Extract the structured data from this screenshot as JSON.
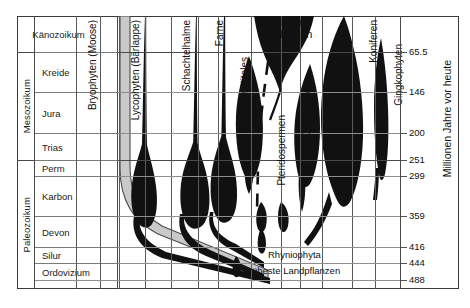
{
  "figure": {
    "axis_title": "Millionen Jahre vor heute",
    "bg_color": "#ffffff",
    "silhouette_color": "#111111",
    "bryophyte_color": "#c9c9c9",
    "rule_color": "#8e8e8e"
  },
  "eons": [
    {
      "label": "Känozoikum",
      "top": 17,
      "bottom": 52
    },
    {
      "label": "Mesozoikum",
      "top": 52,
      "bottom": 160
    },
    {
      "label": "Paleozoikum",
      "top": 160,
      "bottom": 288
    }
  ],
  "periods": [
    {
      "label": "Känozoikum",
      "top": 17,
      "bottom": 52,
      "centered": true
    },
    {
      "label": "Kreide",
      "top": 52,
      "bottom": 92,
      "centered": false
    },
    {
      "label": "Jura",
      "top": 92,
      "bottom": 133,
      "centered": false
    },
    {
      "label": "Trias",
      "top": 133,
      "bottom": 160,
      "centered": false
    },
    {
      "label": "Perm",
      "top": 160,
      "bottom": 176,
      "centered": false
    },
    {
      "label": "Karbon",
      "top": 176,
      "bottom": 216,
      "centered": false
    },
    {
      "label": "Devon",
      "top": 216,
      "bottom": 247,
      "centered": false
    },
    {
      "label": "Silur",
      "top": 247,
      "bottom": 263,
      "centered": false
    },
    {
      "label": "Ordovizium",
      "top": 263,
      "bottom": 280,
      "centered": false
    }
  ],
  "age_axis": {
    "unit_label": "Millionen Jahre vor heute",
    "ticks": [
      {
        "value": "65.5",
        "y": 52
      },
      {
        "value": "146",
        "y": 92
      },
      {
        "value": "200",
        "y": 133
      },
      {
        "value": "251",
        "y": 160
      },
      {
        "value": "299",
        "y": 176
      },
      {
        "value": "359",
        "y": 216
      },
      {
        "value": "416",
        "y": 247
      },
      {
        "value": "444",
        "y": 263
      },
      {
        "value": "488",
        "y": 280
      }
    ]
  },
  "taxa": [
    {
      "name": "Bryophyten (Moose)",
      "label_x": 88,
      "label_y": 20,
      "kind": "gray-band"
    },
    {
      "name": "Lycophyten (Bärlappe)",
      "label_x": 131,
      "label_y": 20,
      "kind": "spindle"
    },
    {
      "name": "Schachtelhalme",
      "label_x": 182,
      "label_y": 20,
      "kind": "spindle"
    },
    {
      "name": "Farne",
      "label_x": 215,
      "label_y": 20,
      "kind": "spindle"
    },
    {
      "name": "Benetitales",
      "label_x": 240,
      "label_y": 57,
      "kind": "spindle"
    },
    {
      "name": "Blüten-Pflanzen",
      "label_x": 281,
      "label_y": 20,
      "kind": "spindle-big"
    },
    {
      "name": "Pteridospermen",
      "label_x": 277,
      "label_y": 115,
      "kind": "dashed"
    },
    {
      "name": "Cycadeen",
      "label_x": 302,
      "label_y": 92,
      "kind": "spindle"
    },
    {
      "name": "Koniferen",
      "label_x": 369,
      "label_y": 20,
      "kind": "spindle"
    },
    {
      "name": "Gingkophyten",
      "label_x": 394,
      "label_y": 44,
      "kind": "spindle"
    }
  ],
  "annotations": [
    {
      "text": "Rhyniophyta",
      "x": 268,
      "y": 255
    },
    {
      "text": "Früheste Landpflanzen",
      "x": 243,
      "y": 271
    }
  ],
  "big_labels": [
    {
      "line1": "Blüten-",
      "line2": "Pflanzen",
      "x": 280,
      "y": 19
    }
  ],
  "lane_separators": [
    76,
    100,
    119,
    145,
    171,
    198,
    218,
    251,
    281,
    300,
    322,
    352,
    375,
    400
  ],
  "chart_data": {
    "type": "area",
    "xlabel": "Relative Diversität (Breite der Spindel)",
    "ylabel": "Millionen Jahre vor heute",
    "ylim": [
      488,
      0
    ],
    "y_ticks": [
      65.5,
      146,
      200,
      251,
      299,
      359,
      416,
      444,
      488
    ],
    "grid": true,
    "legend": "none",
    "categories": [
      "Bryophyten (Moose)",
      "Lycophyten (Bärlappe)",
      "Schachtelhalme",
      "Farne",
      "Benetitales",
      "Blütenpflanzen",
      "Pteridospermen",
      "Cycadeen",
      "Koniferen",
      "Gingkophyten"
    ],
    "series": [
      {
        "name": "Bryophyten (Moose)",
        "first_appearance_ma": 450,
        "present_today": true,
        "peak_ma": 0,
        "note": "graues Band, konstant schmal bis heute"
      },
      {
        "name": "Lycophyten (Bärlappe)",
        "first_appearance_ma": 430,
        "present_today": true,
        "peak_ma": 310,
        "note": "Maximum im Karbon"
      },
      {
        "name": "Schachtelhalme",
        "first_appearance_ma": 400,
        "present_today": true,
        "peak_ma": 310,
        "note": "Maximum im Karbon"
      },
      {
        "name": "Farne",
        "first_appearance_ma": 390,
        "present_today": true,
        "peak_ma": 300,
        "note": "Maximum im Karbon/Perm"
      },
      {
        "name": "Benetitales",
        "first_appearance_ma": 250,
        "present_today": false,
        "extinction_ma": 70,
        "peak_ma": 160
      },
      {
        "name": "Blütenpflanzen",
        "first_appearance_ma": 135,
        "present_today": true,
        "peak_ma": 0,
        "note": "starke Ausbreitung seit Kreide"
      },
      {
        "name": "Pteridospermen",
        "first_appearance_ma": 370,
        "present_today": false,
        "extinction_ma": 100,
        "note": "gestrichelt dargestellt"
      },
      {
        "name": "Cycadeen",
        "first_appearance_ma": 290,
        "present_today": true,
        "peak_ma": 170
      },
      {
        "name": "Koniferen",
        "first_appearance_ma": 340,
        "present_today": true,
        "peak_ma": 150
      },
      {
        "name": "Gingkophyten",
        "first_appearance_ma": 280,
        "present_today": true,
        "peak_ma": 180
      }
    ]
  }
}
